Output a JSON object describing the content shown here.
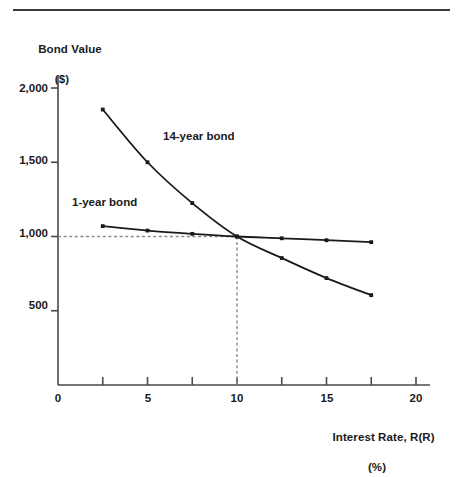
{
  "chart_data": {
    "type": "line",
    "title": "",
    "ylabel": "Bond Value",
    "ylabel_unit": "($)",
    "xlabel": "Interest Rate, R(R)",
    "xlabel_unit": "(%)",
    "xlim": [
      0,
      20
    ],
    "ylim": [
      0,
      2150
    ],
    "grid": false,
    "legend_position": "inline-annotation",
    "x_ticks": [
      0,
      2.5,
      5,
      7.5,
      10,
      12.5,
      15,
      17.5,
      20
    ],
    "x_tick_labels": [
      "0",
      "",
      "5",
      "",
      "10",
      "",
      "15",
      "",
      "20"
    ],
    "y_ticks": [
      500,
      1000,
      1500,
      2000
    ],
    "y_tick_labels": [
      "500",
      "1,000",
      "1,500",
      "2,000"
    ],
    "series": [
      {
        "name": "1-year bond",
        "x": [
          2.5,
          5,
          7.5,
          10,
          12.5,
          15,
          17.5
        ],
        "values": [
          1070,
          1040,
          1018,
          1000,
          988,
          975,
          962
        ]
      },
      {
        "name": "14-year bond",
        "x": [
          2.5,
          5,
          7.5,
          10,
          12.5,
          15,
          17.5
        ],
        "values": [
          1855,
          1500,
          1225,
          1000,
          855,
          720,
          605
        ]
      }
    ],
    "annotations": [
      {
        "text": "14-year bond",
        "x": 7.4,
        "y": 1430
      },
      {
        "text": "1-year bond",
        "x": 3.0,
        "y": 1135
      }
    ],
    "reference_lines": [
      {
        "orientation": "horizontal",
        "value": 1000,
        "from_x": 0,
        "to_x": 10,
        "style": "dashed"
      },
      {
        "orientation": "vertical",
        "value": 10,
        "from_y": 0,
        "to_y": 1000,
        "style": "dashed"
      }
    ],
    "intersection_point": {
      "x": 10,
      "y": 1000
    },
    "colors": {
      "line": "#1a1a1a",
      "axis": "#4a4a4a",
      "dashed": "#8a8a8a",
      "background": "#ffffff",
      "text": "#1a1a1a"
    }
  },
  "labels": {
    "y_title": "Bond Value",
    "y_unit": "($)",
    "x_title": "Interest Rate, R(R)",
    "x_unit": "(%)",
    "y_tick_2000": "2,000",
    "y_tick_1500": "1,500",
    "y_tick_1000": "1,000",
    "y_tick_500": "500",
    "x_tick_0": "0",
    "x_tick_5": "5",
    "x_tick_10": "10",
    "x_tick_15": "15",
    "x_tick_20": "20",
    "series_14": "14-year bond",
    "series_1": "1-year bond"
  }
}
